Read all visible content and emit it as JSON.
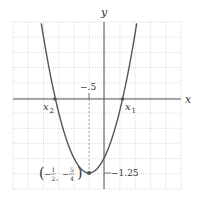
{
  "chart_data": {
    "type": "line",
    "title": "",
    "function": "y = x^2 + x - 1",
    "xlabel": "x",
    "ylabel": "y",
    "xlim": [
      -2.75,
      2.75
    ],
    "ylim": [
      -1.5,
      1.3
    ],
    "grid": true,
    "grid_cells": 11,
    "x_tick_labels": [
      "-.5"
    ],
    "y_tick_labels": [
      "-1.25"
    ],
    "annotations": [
      {
        "text": "x2",
        "x": -1.618,
        "y": 0,
        "role": "root"
      },
      {
        "text": "x1",
        "x": 0.618,
        "y": 0,
        "role": "root"
      },
      {
        "text": "(-1/2, -5/4)",
        "x": -0.5,
        "y": -1.25,
        "role": "vertex"
      }
    ],
    "series": [
      {
        "name": "parabola",
        "x": [
          -2.09,
          -1.618,
          -1.5,
          -1.0,
          -0.5,
          0.0,
          0.5,
          0.618,
          1.09
        ],
        "y": [
          1.28,
          0.0,
          -0.25,
          -1.0,
          -1.25,
          -1.0,
          -0.25,
          0.0,
          1.28
        ]
      }
    ],
    "points": [
      {
        "x": -1.618,
        "y": 0
      },
      {
        "x": 0.618,
        "y": 0
      },
      {
        "x": -0.5,
        "y": -1.25
      }
    ]
  },
  "labels": {
    "x_axis": "x",
    "y_axis": "y",
    "x_tick": "−.5",
    "y_tick": "−1.25",
    "root_left_main": "x",
    "root_left_sub": "2",
    "root_right_main": "x",
    "root_right_sub": "1",
    "vertex_open": "(",
    "vertex_close": ")",
    "vertex_minus": "−",
    "vertex_x_num": "1",
    "vertex_x_den": "2",
    "vertex_comma": ",",
    "vertex_y_num": "5",
    "vertex_y_den": "4"
  }
}
